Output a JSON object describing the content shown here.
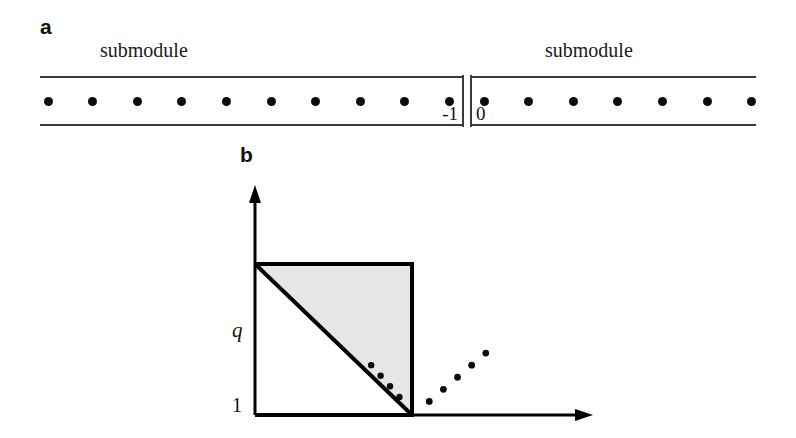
{
  "figure": {
    "width": 796,
    "height": 438,
    "background": "#ffffff"
  },
  "panel_a": {
    "label": "a",
    "title_left": "submodule",
    "title_right": "submodule",
    "left_box": {
      "index_label": "-1",
      "dot_count": 10,
      "open_edge": "left",
      "closed_edge": "right"
    },
    "right_box": {
      "index_label": "0",
      "dot_count": 7,
      "open_edge": "right",
      "closed_edge": "left"
    },
    "dot_color": "#0b0b0b",
    "rule_color": "#3a3a3a"
  },
  "panel_b": {
    "label": "b",
    "axis_x_label": "p",
    "axis_y_label": "q",
    "tick_y_label": "1",
    "shading_color": "#e6e6e6",
    "line_color": "#000000"
  },
  "chart_data": {
    "type": "scatter",
    "title": "",
    "xlabel": "p",
    "ylabel": "q",
    "xlim": [
      0,
      2.4
    ],
    "ylim": [
      0,
      1.55
    ],
    "grid": false,
    "legend": null,
    "xticks": [],
    "yticks": [
      1
    ],
    "ytick_labels": [
      "1"
    ],
    "region": {
      "name": "unit-square",
      "x": [
        0,
        1
      ],
      "y": [
        0,
        1
      ],
      "shaded_subregion": "upper-right triangle above anti-diagonal p+q=1",
      "shaded_fill": "#e6e6e6"
    },
    "lines": [
      {
        "name": "anti-diagonal",
        "from": [
          0,
          1
        ],
        "to": [
          1,
          0
        ],
        "style": "solid",
        "width": 3
      },
      {
        "name": "square-border",
        "points": [
          [
            0,
            1
          ],
          [
            1,
            1
          ],
          [
            1,
            0
          ],
          [
            0,
            0
          ],
          [
            0,
            1
          ]
        ],
        "style": "solid",
        "width": 3
      }
    ],
    "series": [
      {
        "name": "inner-dots",
        "marker": "dot",
        "points": [
          [
            0.74,
            0.33
          ],
          [
            0.8,
            0.26
          ],
          [
            0.86,
            0.19
          ],
          [
            0.92,
            0.12
          ]
        ]
      },
      {
        "name": "outer-dots",
        "marker": "dot",
        "points": [
          [
            1.11,
            0.09
          ],
          [
            1.2,
            0.17
          ],
          [
            1.29,
            0.25
          ],
          [
            1.38,
            0.33
          ],
          [
            1.47,
            0.41
          ]
        ]
      }
    ],
    "axes_arrows": {
      "x": "arrowhead at right end",
      "y": "arrowhead at top end"
    }
  }
}
